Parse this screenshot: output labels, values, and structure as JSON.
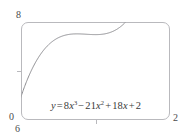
{
  "chart_data": {
    "type": "line",
    "title": "",
    "xlabel": "",
    "ylabel": "",
    "equation_text": "y = 8x^3 - 21x^2 + 18x + 2",
    "equation_parts": {
      "lhs": "y",
      "equals": "=",
      "term1_coeff": "8",
      "term1_var": "x",
      "term1_exp": "3",
      "op1": "−",
      "term2_coeff": "21",
      "term2_var": "x",
      "term2_exp": "2",
      "op2": "+",
      "term3_coeff": "18",
      "term3_var": "x",
      "op3": "+",
      "term4_const": "2"
    },
    "xlim": [
      0,
      2
    ],
    "ylim": [
      0,
      8
    ],
    "x_tick_labels": [
      "0",
      "2"
    ],
    "y_tick_labels": [
      "0",
      "8"
    ],
    "corner_label_below_origin": "6",
    "grid": false,
    "legend": "none",
    "series": [
      {
        "name": "y = 8x^3 - 21x^2 + 18x + 2",
        "color": "#8c8c90",
        "x": [
          0.0,
          0.1,
          0.2,
          0.3,
          0.35,
          0.4,
          0.45,
          0.5,
          0.55,
          0.6,
          0.65,
          0.7,
          0.75,
          0.8,
          0.85,
          0.9,
          0.95,
          1.0,
          1.05,
          1.1,
          1.15,
          1.2,
          1.25,
          1.3,
          1.35,
          1.4,
          1.45,
          1.5,
          1.55,
          1.6,
          1.7,
          1.8,
          2.0
        ],
        "y": [
          2.0,
          2.592,
          3.024,
          3.344,
          3.463,
          3.552,
          3.613,
          3.65,
          3.664,
          3.658,
          3.635,
          3.596,
          3.545,
          3.484,
          3.415,
          3.34,
          3.263,
          3.185,
          3.108,
          3.036,
          2.97,
          2.912,
          2.867,
          2.834,
          2.817,
          2.818,
          2.839,
          2.882,
          2.95,
          3.044,
          3.328,
          3.752,
          5.0
        ]
      }
    ],
    "axis_color": "#b9b9bd",
    "curve_color": "#8c8c90",
    "label_color": "#4a4a4a",
    "background": "#ffffff"
  },
  "frame": {
    "name": "plot-frame",
    "rounded": true
  },
  "ticks": {
    "y_mid": "",
    "x_mid": ""
  }
}
